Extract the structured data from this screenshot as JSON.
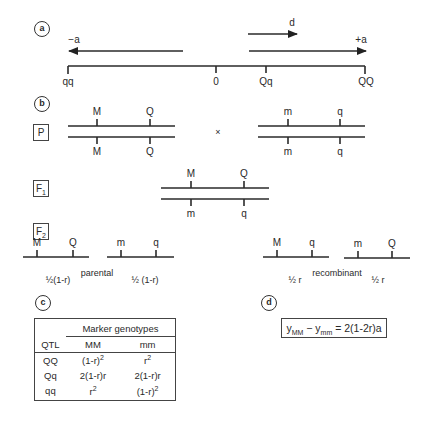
{
  "panel_a": {
    "label": "a",
    "left_arrow_label": "−a",
    "dominance_arrow_label": "d",
    "right_arrow_label": "+a",
    "axis_ticks": [
      {
        "label": "qq",
        "x": 68
      },
      {
        "label": "0",
        "x": 216
      },
      {
        "label": "Qq",
        "x": 266
      },
      {
        "label": "QQ",
        "x": 365
      }
    ]
  },
  "panel_b": {
    "label": "b",
    "generations": {
      "P": "P",
      "F1": "F",
      "F1_sub": "1",
      "F2": "F",
      "F2_sub": "2"
    },
    "cross_symbol": "×",
    "parent1": {
      "top": [
        "M",
        "Q"
      ],
      "bottom": [
        "M",
        "Q"
      ]
    },
    "parent2": {
      "top": [
        "m",
        "q"
      ],
      "bottom": [
        "m",
        "q"
      ]
    },
    "f1": {
      "top": [
        "M",
        "Q"
      ],
      "bottom": [
        "m",
        "q"
      ]
    },
    "f2_gametes": [
      {
        "alleles": [
          "M",
          "Q"
        ],
        "freq": "½(1-r)"
      },
      {
        "alleles": [
          "m",
          "q"
        ],
        "freq": "½ (1-r)"
      },
      {
        "alleles": [
          "M",
          "q"
        ],
        "freq": "½ r"
      },
      {
        "alleles": [
          "m",
          "Q"
        ],
        "freq": "½ r"
      }
    ],
    "parental_label": "parental",
    "recombinant_label": "recombinant"
  },
  "panel_c": {
    "label": "c",
    "header_group": "Marker genotypes",
    "columns": [
      "QTL",
      "MM",
      "mm"
    ],
    "rows": [
      {
        "qtl": "QQ",
        "MM": "(1-r)",
        "MM_sup": "2",
        "mm": "r",
        "mm_sup": "2"
      },
      {
        "qtl": "Qq",
        "MM": "2(1-r)r",
        "MM_sup": "",
        "mm": "2(1-r)r",
        "mm_sup": ""
      },
      {
        "qtl": "qq",
        "MM": "r",
        "MM_sup": "2",
        "mm": "(1-r)",
        "mm_sup": "2"
      }
    ]
  },
  "panel_d": {
    "label": "d",
    "formula": {
      "y1": "y",
      "sub1": "MM",
      "minus": " − ",
      "y2": "y",
      "sub2": "mm",
      "rhs": " = 2(1-2r)a"
    }
  }
}
